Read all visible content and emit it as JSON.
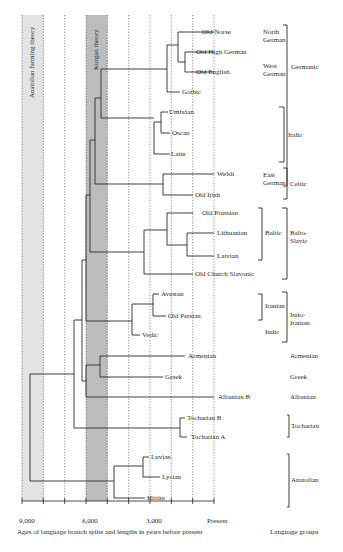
{
  "theories": {
    "anatolian": {
      "label": "Anatolian farming theory",
      "color": "#e2e2e2"
    },
    "kurgan": {
      "label": "Kurgan theory",
      "color": "#b9b9b9"
    }
  },
  "axis": {
    "ticks": [
      {
        "label": "9,000",
        "value": 9000
      },
      {
        "label": "6,000",
        "value": 6000
      },
      {
        "label": "3,000",
        "value": 3000
      },
      {
        "label": "Present",
        "value": 0
      }
    ],
    "caption": "Ages of language branch splits and lengths in years before present",
    "groups_caption": "Language groups"
  },
  "languages": [
    {
      "name": "Old Norse"
    },
    {
      "name": "Old High German"
    },
    {
      "name": "Old English"
    },
    {
      "name": "Gothic"
    },
    {
      "name": "Umbrian"
    },
    {
      "name": "Oscan"
    },
    {
      "name": "Latin"
    },
    {
      "name": "Welsh"
    },
    {
      "name": "Old Irish"
    },
    {
      "name": "Old Prussian"
    },
    {
      "name": "Lithuanian"
    },
    {
      "name": "Latvian"
    },
    {
      "name": "Old Church Slavonic"
    },
    {
      "name": "Avestan"
    },
    {
      "name": "Old Persian"
    },
    {
      "name": "Vedic"
    },
    {
      "name": "Armenian"
    },
    {
      "name": "Greek"
    },
    {
      "name": "Albanian B"
    },
    {
      "name": "Tocharian B"
    },
    {
      "name": "Tocharian A"
    },
    {
      "name": "Luvian"
    },
    {
      "name": "Lycian"
    },
    {
      "name": "Hittite"
    }
  ],
  "subgroups": {
    "north_german": "North German",
    "west_german": "West German",
    "east_german": "East German",
    "baltic": "Baltic",
    "iranian": "Iranian",
    "indic": "Indic"
  },
  "groups": {
    "germanic": "Germanic",
    "italic": "Italic",
    "celtic": "Celtic",
    "balto_slavic": "Balto-Slavic",
    "indo_iranian": "Indo-Iranian",
    "armenian": "Armenian",
    "greek": "Greek",
    "albanian": "Albanian",
    "tocharian": "Tocharian",
    "anatolian": "Anatolian"
  }
}
